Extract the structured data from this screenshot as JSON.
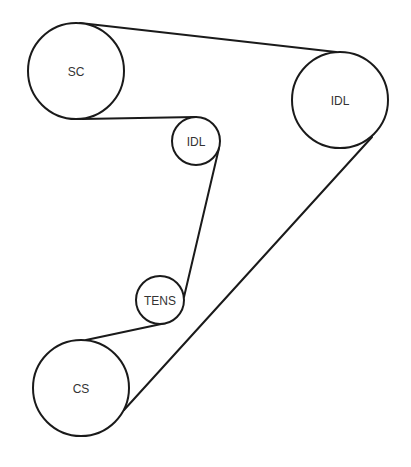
{
  "diagram": {
    "type": "belt-routing",
    "pulleys": [
      {
        "id": "sc",
        "label": "SC",
        "cx": 76,
        "cy": 71,
        "r": 48
      },
      {
        "id": "idl-large",
        "label": "IDL",
        "cx": 340,
        "cy": 100,
        "r": 48
      },
      {
        "id": "idl-small",
        "label": "IDL",
        "cx": 196,
        "cy": 141,
        "r": 24
      },
      {
        "id": "tens",
        "label": "TENS",
        "cx": 160,
        "cy": 300,
        "r": 24
      },
      {
        "id": "cs",
        "label": "CS",
        "cx": 81,
        "cy": 388,
        "r": 48
      }
    ],
    "belt_segments": [
      {
        "from": "sc",
        "to": "idl-large",
        "x1": 80,
        "y1": 23,
        "x2": 336,
        "y2": 52
      },
      {
        "from": "sc",
        "to": "idl-small",
        "x1": 82,
        "y1": 119,
        "x2": 196,
        "y2": 117
      },
      {
        "from": "idl-small",
        "to": "tens",
        "x1": 219,
        "y1": 148,
        "x2": 184,
        "y2": 297
      },
      {
        "from": "tens",
        "to": "cs",
        "x1": 166,
        "y1": 323,
        "x2": 86,
        "y2": 340
      },
      {
        "from": "cs",
        "to": "idl-large",
        "x1": 124,
        "y1": 410,
        "x2": 372,
        "y2": 137
      }
    ]
  }
}
